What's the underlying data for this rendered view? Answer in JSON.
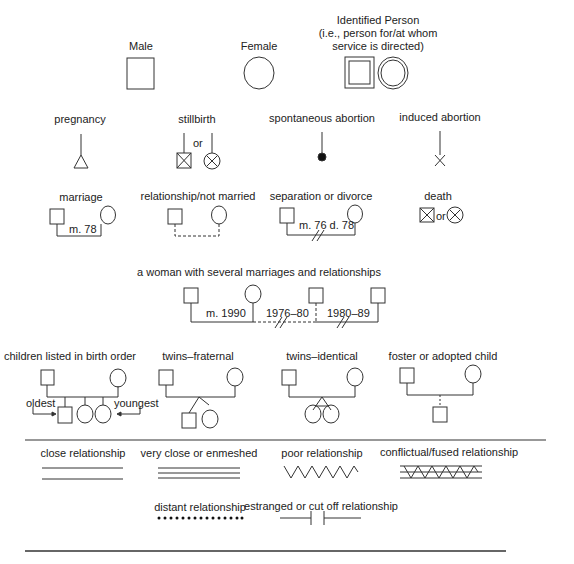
{
  "row1": {
    "male": {
      "label": "Male"
    },
    "female": {
      "label": "Female"
    },
    "identified": {
      "label_line1": "Identified Person",
      "label_line2": "(i.e., person for/at whom",
      "label_line3": "service is directed)"
    }
  },
  "row2": {
    "pregnancy": {
      "label": "pregnancy"
    },
    "stillbirth": {
      "label": "stillbirth",
      "or": "or"
    },
    "spontaneous_abortion": {
      "label": "spontaneous abortion"
    },
    "induced_abortion": {
      "label": "induced abortion"
    }
  },
  "row3": {
    "marriage": {
      "label": "marriage",
      "date": "m. 78"
    },
    "relationship": {
      "label": "relationship/not married"
    },
    "divorce": {
      "label": "separation or divorce",
      "date": "m. 76 d. 78"
    },
    "death": {
      "label": "death",
      "or": "or"
    }
  },
  "row4": {
    "label": "a woman with several marriages and relationships",
    "marriage_date": "m. 1990",
    "rel1_dates": "1976–80",
    "rel2_dates": "1980–89"
  },
  "row5": {
    "birth_order": {
      "label": "children listed in birth order",
      "oldest": "oldest",
      "youngest": "youngest"
    },
    "twins_fraternal": {
      "label": "twins–fraternal"
    },
    "twins_identical": {
      "label": "twins–identical"
    },
    "foster": {
      "label": "foster or adopted child"
    }
  },
  "relationships": {
    "close": {
      "label": "close relationship"
    },
    "very_close": {
      "label": "very close or enmeshed"
    },
    "poor": {
      "label": "poor relationship"
    },
    "conflictual": {
      "label": "conflictual/fused relationship"
    },
    "distant": {
      "label": "distant relationship"
    },
    "estranged": {
      "label": "estranged or cut off relationship"
    }
  },
  "colors": {
    "line": "#333333",
    "background": "#ffffff"
  }
}
